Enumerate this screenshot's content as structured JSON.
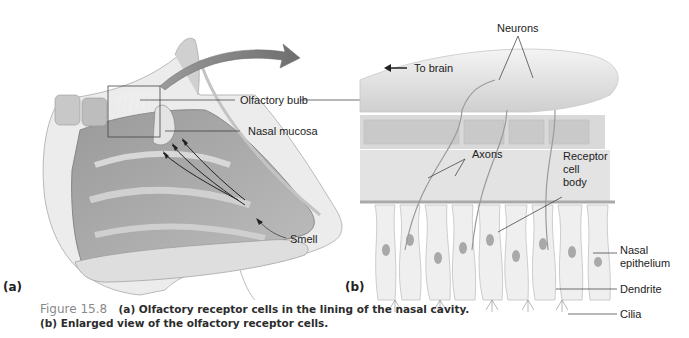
{
  "figure": {
    "number": "Figure 15.8",
    "caption_line1": "(a) Olfactory receptor cells in the lining of the nasal cavity.",
    "caption_line2": "(b) Enlarged view of the olfactory receptor cells."
  },
  "panel_a": {
    "letter": "(a)",
    "labels": {
      "olfactory_bulb": "Olfactory bulb",
      "nasal_mucosa": "Nasal mucosa",
      "smell": "Smell"
    }
  },
  "panel_b": {
    "letter": "(b)",
    "labels": {
      "neurons": "Neurons",
      "to_brain": "To brain",
      "axons": "Axons",
      "receptor_cell_body_1": "Receptor",
      "receptor_cell_body_2": "cell",
      "receptor_cell_body_3": "body",
      "nasal_epithelium_1": "Nasal",
      "nasal_epithelium_2": "epithelium",
      "dendrite": "Dendrite",
      "cilia": "Cilia"
    }
  },
  "colors": {
    "tissue_dark": "#8c8c8c",
    "tissue_mid": "#b5b5b5",
    "tissue_light": "#dcdcdc",
    "arrow": "#7a7a7a",
    "line": "#333333"
  }
}
